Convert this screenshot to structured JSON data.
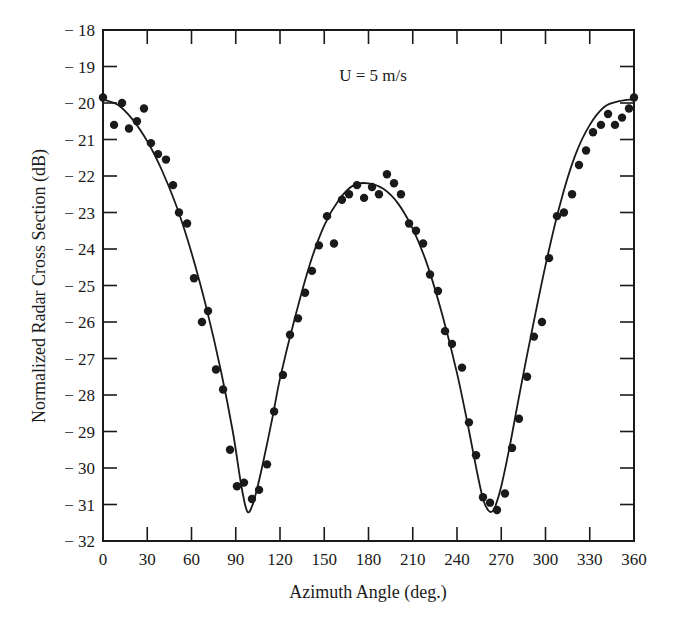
{
  "chart_data": {
    "type": "scatter",
    "title": "",
    "annotation": "U = 5 m/s",
    "xlabel": "Azimuth Angle (deg.)",
    "ylabel": "Normalized Radar Cross Section (dB)",
    "xlim": [
      0,
      360
    ],
    "ylim": [
      -32,
      -18
    ],
    "xticks": [
      0,
      30,
      60,
      90,
      120,
      150,
      180,
      210,
      240,
      270,
      300,
      330,
      360
    ],
    "yticks": [
      -18,
      -19,
      -20,
      -21,
      -22,
      -23,
      -24,
      -25,
      -26,
      -27,
      -28,
      -29,
      -30,
      -31,
      -32
    ],
    "xtick_labels": [
      "0",
      "30",
      "60",
      "90",
      "120",
      "150",
      "180",
      "210",
      "240",
      "270",
      "300",
      "330",
      "360"
    ],
    "ytick_labels": [
      "-18",
      "-19",
      "-20",
      "-21",
      "-22",
      "-23",
      "-24",
      "-25",
      "-26",
      "-27",
      "-28",
      "-29",
      "-30",
      "-31",
      "-32"
    ],
    "grid": false,
    "legend": null,
    "series": [
      {
        "name": "Measured",
        "type": "scatter",
        "marker": "filled-circle",
        "color": "#1a1a1a",
        "points": [
          [
            0,
            -19.85
          ],
          [
            7.5,
            -20.6
          ],
          [
            12.9,
            -20.0
          ],
          [
            17.6,
            -20.7
          ],
          [
            23,
            -20.5
          ],
          [
            27.8,
            -20.15
          ],
          [
            32.5,
            -21.1
          ],
          [
            37.3,
            -21.4
          ],
          [
            42.7,
            -21.55
          ],
          [
            47.5,
            -22.25
          ],
          [
            51.5,
            -23.0
          ],
          [
            57,
            -23.3
          ],
          [
            61.7,
            -24.8
          ],
          [
            67.1,
            -26.0
          ],
          [
            71.2,
            -25.7
          ],
          [
            76.6,
            -27.3
          ],
          [
            81.4,
            -27.85
          ],
          [
            86.1,
            -29.5
          ],
          [
            90.8,
            -30.5
          ],
          [
            95.6,
            -30.4
          ],
          [
            101,
            -30.85
          ],
          [
            105.8,
            -30.6
          ],
          [
            111.2,
            -29.9
          ],
          [
            116,
            -28.45
          ],
          [
            122,
            -27.45
          ],
          [
            126.8,
            -26.35
          ],
          [
            132.2,
            -25.9
          ],
          [
            137,
            -25.2
          ],
          [
            141.7,
            -24.6
          ],
          [
            146.4,
            -23.9
          ],
          [
            151.9,
            -23.1
          ],
          [
            156.6,
            -23.85
          ],
          [
            162,
            -22.65
          ],
          [
            166.8,
            -22.5
          ],
          [
            172.2,
            -22.25
          ],
          [
            177,
            -22.6
          ],
          [
            182.4,
            -22.3
          ],
          [
            187.1,
            -22.5
          ],
          [
            192.5,
            -21.95
          ],
          [
            197.3,
            -22.2
          ],
          [
            202,
            -22.5
          ],
          [
            207.5,
            -23.3
          ],
          [
            212.2,
            -23.5
          ],
          [
            217,
            -23.85
          ],
          [
            221.7,
            -24.7
          ],
          [
            227.1,
            -25.15
          ],
          [
            231.9,
            -26.25
          ],
          [
            236.6,
            -26.6
          ],
          [
            243.4,
            -27.25
          ],
          [
            248.1,
            -28.75
          ],
          [
            252.9,
            -29.65
          ],
          [
            257.6,
            -30.8
          ],
          [
            262.4,
            -30.95
          ],
          [
            267.1,
            -31.15
          ],
          [
            272.5,
            -30.7
          ],
          [
            277.3,
            -29.45
          ],
          [
            282,
            -28.65
          ],
          [
            287.5,
            -27.5
          ],
          [
            292.2,
            -26.4
          ],
          [
            297.6,
            -26.0
          ],
          [
            302.4,
            -24.25
          ],
          [
            307.8,
            -23.1
          ],
          [
            312.5,
            -23.0
          ],
          [
            318,
            -22.5
          ],
          [
            322.7,
            -21.7
          ],
          [
            327.5,
            -21.3
          ],
          [
            332.2,
            -20.8
          ],
          [
            337.6,
            -20.6
          ],
          [
            342.4,
            -20.3
          ],
          [
            347.1,
            -20.6
          ],
          [
            351.9,
            -20.4
          ],
          [
            356.6,
            -20.15
          ],
          [
            360,
            -19.85
          ]
        ]
      },
      {
        "name": "Model fit",
        "type": "line",
        "color": "#1a1a1a",
        "points": [
          [
            0,
            -19.9
          ],
          [
            10,
            -20.05
          ],
          [
            20,
            -20.45
          ],
          [
            30,
            -21.05
          ],
          [
            40,
            -21.85
          ],
          [
            50,
            -22.85
          ],
          [
            60,
            -24.1
          ],
          [
            70,
            -25.6
          ],
          [
            80,
            -27.35
          ],
          [
            88,
            -29.0
          ],
          [
            93,
            -30.3
          ],
          [
            96,
            -30.95
          ],
          [
            98,
            -31.2
          ],
          [
            100,
            -31.15
          ],
          [
            103,
            -30.8
          ],
          [
            108,
            -29.95
          ],
          [
            115,
            -28.6
          ],
          [
            120,
            -27.55
          ],
          [
            130,
            -25.9
          ],
          [
            140,
            -24.45
          ],
          [
            150,
            -23.35
          ],
          [
            160,
            -22.65
          ],
          [
            170,
            -22.25
          ],
          [
            180,
            -22.2
          ],
          [
            190,
            -22.35
          ],
          [
            200,
            -22.75
          ],
          [
            210,
            -23.45
          ],
          [
            220,
            -24.45
          ],
          [
            230,
            -25.8
          ],
          [
            240,
            -27.4
          ],
          [
            248,
            -28.95
          ],
          [
            254,
            -30.2
          ],
          [
            258,
            -30.9
          ],
          [
            261,
            -31.15
          ],
          [
            263.5,
            -31.2
          ],
          [
            266,
            -31.05
          ],
          [
            270,
            -30.5
          ],
          [
            276,
            -29.35
          ],
          [
            282,
            -28.05
          ],
          [
            290,
            -26.4
          ],
          [
            300,
            -24.45
          ],
          [
            310,
            -22.75
          ],
          [
            320,
            -21.45
          ],
          [
            330,
            -20.6
          ],
          [
            340,
            -20.1
          ],
          [
            350,
            -19.95
          ],
          [
            360,
            -19.9
          ]
        ]
      }
    ]
  }
}
